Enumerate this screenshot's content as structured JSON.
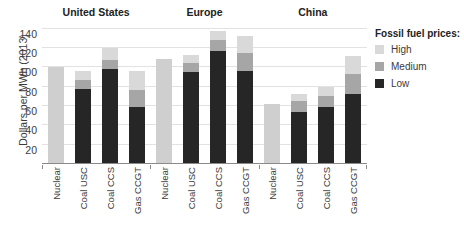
{
  "chart_data": {
    "type": "bar",
    "title": "",
    "xlabel": "",
    "ylabel": "Dollars per MWh (2013)",
    "ylim": [
      0,
      145
    ],
    "yticks": [
      20,
      40,
      60,
      80,
      100,
      120,
      140
    ],
    "grid": true,
    "stacked": true,
    "legend": {
      "title": "Fossil fuel prices:",
      "position": "right",
      "entries": [
        {
          "name": "High",
          "color": "#d9d9d9"
        },
        {
          "name": "Medium",
          "color": "#a6a6a6"
        },
        {
          "name": "Low",
          "color": "#262626"
        }
      ]
    },
    "groups": [
      {
        "name": "United States",
        "categories": [
          "Nuclear",
          "Coal USC",
          "Coal CCS",
          "Gas CCGT"
        ],
        "bars": [
          {
            "category": "Nuclear",
            "low": null,
            "medium": null,
            "high": null,
            "total": 100,
            "single": true
          },
          {
            "category": "Coal USC",
            "low": 78,
            "medium": 87,
            "high": 96,
            "total": 96,
            "single": false
          },
          {
            "category": "Coal CCS",
            "low": 98,
            "medium": 108,
            "high": 120,
            "total": 120,
            "single": false
          },
          {
            "category": "Gas CCGT",
            "low": 59,
            "medium": 77,
            "high": 96,
            "total": 96,
            "single": false
          }
        ]
      },
      {
        "name": "Europe",
        "categories": [
          "Nuclear",
          "Coal USC",
          "Coal CCS",
          "Gas CCGT"
        ],
        "bars": [
          {
            "category": "Nuclear",
            "low": null,
            "medium": null,
            "high": null,
            "total": 109,
            "single": true
          },
          {
            "category": "Coal USC",
            "low": 95,
            "medium": 105,
            "high": 113,
            "total": 113,
            "single": false
          },
          {
            "category": "Coal CCS",
            "low": 117,
            "medium": 128,
            "high": 138,
            "total": 138,
            "single": false
          },
          {
            "category": "Gas CCGT",
            "low": 96,
            "medium": 115,
            "high": 133,
            "total": 133,
            "single": false
          }
        ]
      },
      {
        "name": "China",
        "categories": [
          "Nuclear",
          "Coal USC",
          "Coal CCS",
          "Gas CCGT"
        ],
        "bars": [
          {
            "category": "Nuclear",
            "low": null,
            "medium": null,
            "high": null,
            "total": 62,
            "single": true
          },
          {
            "category": "Coal USC",
            "low": 54,
            "medium": 65,
            "high": 73,
            "total": 73,
            "single": false
          },
          {
            "category": "Coal CCS",
            "low": 59,
            "medium": 70,
            "high": 80,
            "total": 80,
            "single": false
          },
          {
            "category": "Gas CCGT",
            "low": 73,
            "medium": 93,
            "high": 112,
            "total": 112,
            "single": false
          }
        ]
      }
    ],
    "colors": {
      "high": "#d9d9d9",
      "medium": "#a6a6a6",
      "low": "#262626",
      "single": "#cfcfcf",
      "grid": "#e2e2e2",
      "axis": "#8a8a8a"
    }
  }
}
